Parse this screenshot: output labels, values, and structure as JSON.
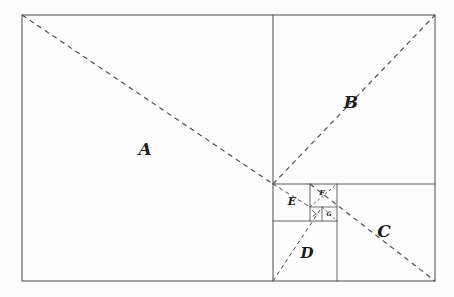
{
  "figure": {
    "canvas": {
      "width": 454,
      "height": 297
    },
    "background_color": "#fdfdfd",
    "line_color": "#5a5a5a",
    "dash_color": "#4a4a4a",
    "label_color": "#1c1c1c",
    "outer_rect": {
      "x": 22,
      "y": 15,
      "width": 413,
      "height": 266
    }
  },
  "regions": [
    {
      "id": "A",
      "label": "A",
      "label_x": 145,
      "label_y": 150,
      "label_size": "lbl-xl",
      "rect": {
        "x": 22,
        "y": 15,
        "width": 251,
        "height": 266
      }
    },
    {
      "id": "B",
      "label": "B",
      "label_x": 351,
      "label_y": 103,
      "label_size": "lbl-xl",
      "rect": {
        "x": 273,
        "y": 15,
        "width": 162,
        "height": 169
      }
    },
    {
      "id": "C",
      "label": "C",
      "label_x": 384,
      "label_y": 232,
      "label_size": "lbl-xl",
      "rect": {
        "x": 337,
        "y": 184,
        "width": 98,
        "height": 97
      }
    },
    {
      "id": "D",
      "label": "D",
      "label_x": 307,
      "label_y": 254,
      "label_size": "lbl-lg",
      "rect": {
        "x": 273,
        "y": 221,
        "width": 64,
        "height": 60
      }
    },
    {
      "id": "E",
      "label": "E",
      "label_x": 292,
      "label_y": 202,
      "label_size": "lbl-md",
      "rect": {
        "x": 273,
        "y": 184,
        "width": 37,
        "height": 37
      }
    },
    {
      "id": "F",
      "label": "F",
      "label_x": 322,
      "label_y": 193,
      "label_size": "lbl-sm",
      "rect": {
        "x": 310,
        "y": 184,
        "width": 27,
        "height": 23
      }
    },
    {
      "id": "G",
      "label": "G",
      "label_x": 329,
      "label_y": 214,
      "label_size": "lbl-xs",
      "rect": {
        "x": 322,
        "y": 207,
        "width": 15,
        "height": 14
      }
    },
    {
      "id": "H",
      "label": "",
      "label_x": 316,
      "label_y": 214,
      "label_size": "lbl-xs",
      "rect": {
        "x": 310,
        "y": 207,
        "width": 12,
        "height": 14
      }
    }
  ],
  "internal_lines": [
    {
      "name": "divider-a-right",
      "x1": 273,
      "y1": 15,
      "x2": 273,
      "y2": 281,
      "weight": ""
    },
    {
      "name": "divider-b-bottom",
      "x1": 273,
      "y1": 184,
      "x2": 435,
      "y2": 184,
      "weight": ""
    },
    {
      "name": "divider-d-top",
      "x1": 273,
      "y1": 221,
      "x2": 337,
      "y2": 221,
      "weight": "thin"
    },
    {
      "name": "divider-d-right",
      "x1": 337,
      "y1": 184,
      "x2": 337,
      "y2": 281,
      "weight": "thin"
    },
    {
      "name": "divider-e-right",
      "x1": 310,
      "y1": 184,
      "x2": 310,
      "y2": 221,
      "weight": "thin"
    },
    {
      "name": "divider-f-bottom",
      "x1": 310,
      "y1": 207,
      "x2": 337,
      "y2": 207,
      "weight": "hair"
    },
    {
      "name": "divider-g-left",
      "x1": 322,
      "y1": 207,
      "x2": 322,
      "y2": 221,
      "weight": "hair"
    }
  ],
  "diagonals": [
    {
      "name": "diagonal-a",
      "x1": 22,
      "y1": 15,
      "x2": 273,
      "y2": 184,
      "weight": ""
    },
    {
      "name": "diagonal-b",
      "x1": 273,
      "y1": 184,
      "x2": 435,
      "y2": 15,
      "weight": ""
    },
    {
      "name": "diagonal-c",
      "x1": 310,
      "y1": 184,
      "x2": 435,
      "y2": 281,
      "weight": ""
    },
    {
      "name": "diagonal-d",
      "x1": 273,
      "y1": 281,
      "x2": 322,
      "y2": 207,
      "weight": "short"
    },
    {
      "name": "diagonal-e",
      "x1": 273,
      "y1": 184,
      "x2": 310,
      "y2": 207,
      "weight": "short"
    },
    {
      "name": "diagonal-f",
      "x1": 310,
      "y1": 207,
      "x2": 337,
      "y2": 184,
      "weight": "tiny"
    },
    {
      "name": "diagonal-g",
      "x1": 322,
      "y1": 207,
      "x2": 337,
      "y2": 221,
      "weight": "tiny"
    }
  ],
  "tick_marks": [
    {
      "name": "tick-h-box",
      "x1": 312,
      "y1": 210,
      "x2": 316,
      "y2": 214
    },
    {
      "name": "tick-h-box-2",
      "x1": 316,
      "y1": 214,
      "x2": 313,
      "y2": 216
    }
  ]
}
